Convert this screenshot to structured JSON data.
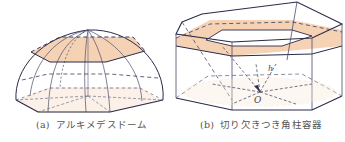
{
  "figures": [
    {
      "tag": "(a)",
      "caption": "アルキメデスドーム",
      "shape": "Archimedean dome (hexagonal-base segmented dome) with shaded hexagonal horizontal cross-section"
    },
    {
      "tag": "(b)",
      "caption": "切り欠きつき角柱容器",
      "shape": "Notched hexagonal prism container with shaded ring-shaped cross-section and dashed rays to origin",
      "labels": {
        "origin": "O",
        "height": "h"
      }
    }
  ],
  "colors": {
    "edge": "#2a2a4a",
    "hidden_edge": "#3a3a5a",
    "shade": "#f5d2b4",
    "shade_edge": "#e0a882",
    "caption_text": "#555555"
  }
}
